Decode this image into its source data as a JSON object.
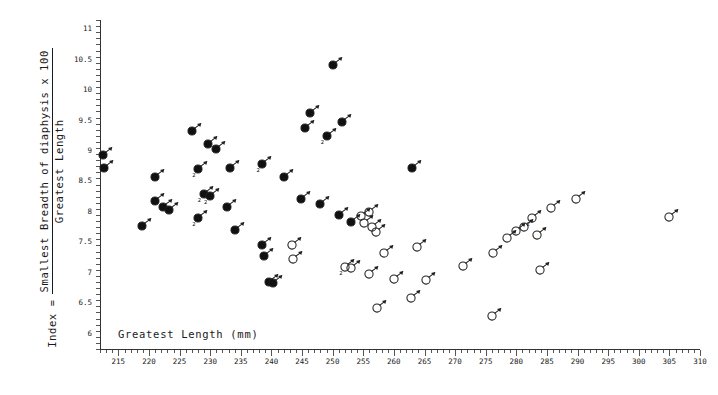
{
  "chart_data": {
    "type": "scatter",
    "title": "",
    "xlabel": "Greatest Length (mm)",
    "ylabel_prefix": "Index =",
    "ylabel_numerator": "Smallest Breadth of diaphysis x 100",
    "ylabel_denominator": "Greatest Length",
    "xlim": [
      212,
      310
    ],
    "ylim": [
      5.75,
      11.15
    ],
    "x_ticks": [
      215,
      220,
      225,
      230,
      235,
      240,
      245,
      250,
      255,
      260,
      265,
      270,
      275,
      280,
      285,
      290,
      295,
      300,
      305,
      310
    ],
    "x_tick_labels": [
      "215",
      "220",
      "225",
      "230",
      "235",
      "240",
      "245",
      "250",
      "255",
      "260",
      "265",
      "270",
      "275",
      "280",
      "285",
      "290",
      "295",
      "300",
      "305",
      "310"
    ],
    "x_minor_step": 1,
    "y_ticks": [
      6,
      6.5,
      7,
      7.5,
      8,
      8.5,
      9,
      9.5,
      10,
      10.5,
      11
    ],
    "y_tick_labels": [
      "6",
      "6.5",
      "7",
      "7.5",
      "8",
      "8.5",
      "9",
      "9.5",
      "10",
      "10.5",
      "11"
    ],
    "y_minor_step": 0.1,
    "grid": false,
    "legend": "none",
    "series": [
      {
        "name": "filled-male",
        "marker": "filled-circle-male",
        "fill": "#111111",
        "points": [
          {
            "x": 227.0,
            "y": 9.33
          },
          {
            "x": 229.6,
            "y": 9.12
          },
          {
            "x": 231.0,
            "y": 9.03
          },
          {
            "x": 233.2,
            "y": 8.72
          },
          {
            "x": 238.5,
            "y": 8.78,
            "n": 2
          },
          {
            "x": 242.0,
            "y": 8.58
          },
          {
            "x": 245.5,
            "y": 9.38
          },
          {
            "x": 246.3,
            "y": 9.63
          },
          {
            "x": 249.0,
            "y": 9.25,
            "n": 2
          },
          {
            "x": 250.0,
            "y": 10.42
          },
          {
            "x": 251.6,
            "y": 9.48
          },
          {
            "x": 244.8,
            "y": 8.22
          },
          {
            "x": 248.0,
            "y": 8.13
          },
          {
            "x": 251.0,
            "y": 7.95
          },
          {
            "x": 253.0,
            "y": 7.83
          },
          {
            "x": 263.0,
            "y": 8.72
          }
        ]
      },
      {
        "name": "filled-female",
        "marker": "filled-circle-female",
        "fill": "#111111",
        "points": [
          {
            "x": 212.5,
            "y": 8.93
          },
          {
            "x": 212.6,
            "y": 8.72
          },
          {
            "x": 218.8,
            "y": 7.77
          },
          {
            "x": 220.9,
            "y": 8.18
          },
          {
            "x": 222.3,
            "y": 8.08
          },
          {
            "x": 223.2,
            "y": 8.03
          },
          {
            "x": 221.0,
            "y": 8.58
          },
          {
            "x": 228.0,
            "y": 8.7,
            "n": 2
          },
          {
            "x": 228.9,
            "y": 8.3,
            "n": 2
          },
          {
            "x": 229.9,
            "y": 8.27,
            "n": 2
          },
          {
            "x": 228.0,
            "y": 7.9,
            "n": 2
          },
          {
            "x": 232.7,
            "y": 8.08
          },
          {
            "x": 234.0,
            "y": 7.7
          },
          {
            "x": 238.4,
            "y": 7.45
          },
          {
            "x": 238.8,
            "y": 7.28
          },
          {
            "x": 239.6,
            "y": 6.85
          },
          {
            "x": 240.2,
            "y": 6.83
          }
        ]
      },
      {
        "name": "open-male",
        "marker": "open-circle-male",
        "fill": "none",
        "points": [
          {
            "x": 254.6,
            "y": 7.93
          },
          {
            "x": 256.0,
            "y": 8.0
          },
          {
            "x": 263.8,
            "y": 7.43
          },
          {
            "x": 271.3,
            "y": 7.12
          },
          {
            "x": 276.2,
            "y": 7.32
          },
          {
            "x": 278.5,
            "y": 7.58
          },
          {
            "x": 280.0,
            "y": 7.68
          },
          {
            "x": 281.3,
            "y": 7.75
          },
          {
            "x": 282.6,
            "y": 7.9,
            "n": 2
          },
          {
            "x": 283.4,
            "y": 7.62
          },
          {
            "x": 283.8,
            "y": 7.05
          },
          {
            "x": 285.6,
            "y": 8.07
          },
          {
            "x": 289.8,
            "y": 8.22
          },
          {
            "x": 305.0,
            "y": 7.92
          }
        ]
      },
      {
        "name": "open-female",
        "marker": "open-circle-female",
        "fill": "none",
        "points": [
          {
            "x": 243.4,
            "y": 7.46
          },
          {
            "x": 243.5,
            "y": 7.23
          },
          {
            "x": 252.0,
            "y": 7.1,
            "n": 2
          },
          {
            "x": 253.0,
            "y": 7.08
          },
          {
            "x": 255.1,
            "y": 7.82
          },
          {
            "x": 256.4,
            "y": 7.75
          },
          {
            "x": 257.0,
            "y": 7.67
          },
          {
            "x": 256.0,
            "y": 6.98
          },
          {
            "x": 257.2,
            "y": 6.42
          },
          {
            "x": 258.3,
            "y": 7.32
          },
          {
            "x": 260.0,
            "y": 6.9
          },
          {
            "x": 262.8,
            "y": 6.58
          },
          {
            "x": 265.2,
            "y": 6.88
          },
          {
            "x": 276.0,
            "y": 6.3
          }
        ]
      }
    ]
  }
}
